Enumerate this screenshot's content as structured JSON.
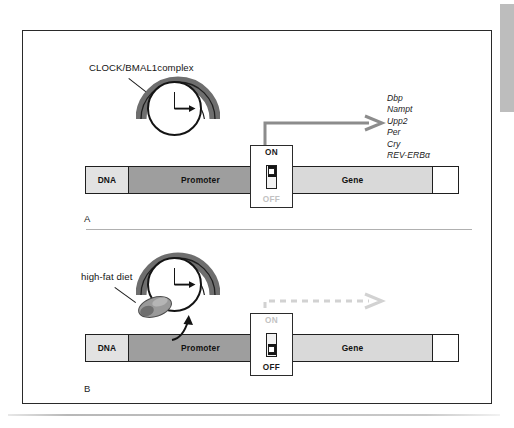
{
  "figure": {
    "type": "scientific-diagram",
    "panels": [
      {
        "id": "A",
        "label": "A",
        "state": "ON",
        "clock_label": "CLOCK/BMAL1complex",
        "switch": {
          "on_label": "ON",
          "off_label": "OFF",
          "position": "on"
        },
        "dna": {
          "segments": [
            {
              "name": "DNA",
              "label": "DNA",
              "shade": "light"
            },
            {
              "name": "Promoter",
              "label": "Promoter",
              "shade": "dark"
            },
            {
              "name": "Gene",
              "label": "Gene",
              "shade": "mid"
            },
            {
              "name": "tail",
              "label": "",
              "shade": "white"
            }
          ]
        },
        "arrow": {
          "style": "solid",
          "color": "#8c8c8c",
          "meaning": "active transcription"
        },
        "target_genes": [
          "Dbp",
          "Nampt",
          "Upp2",
          "Per",
          "Cry",
          "REV-ERBα"
        ]
      },
      {
        "id": "B",
        "label": "B",
        "state": "OFF",
        "perturbation_label": "high-fat diet",
        "switch": {
          "on_label": "ON",
          "off_label": "OFF",
          "position": "off"
        },
        "dna": {
          "segments": [
            {
              "name": "DNA",
              "label": "DNA",
              "shade": "light"
            },
            {
              "name": "Promoter",
              "label": "Promoter",
              "shade": "dark"
            },
            {
              "name": "Gene",
              "label": "Gene",
              "shade": "mid"
            },
            {
              "name": "tail",
              "label": "",
              "shade": "white"
            }
          ]
        },
        "arrow": {
          "style": "dashed",
          "color": "#d2d2d2",
          "meaning": "suppressed transcription"
        },
        "target_genes": []
      }
    ],
    "colors": {
      "promoter": "#9e9e9e",
      "gene": "#d9d9d9",
      "dna_block": "#e2e2e2",
      "complex_arc": "#6e6e6e",
      "arrow_active": "#8c8c8c",
      "arrow_suppressed": "#d2d2d2",
      "outline": "#1f1f1f",
      "mouse": "#9a9a9a"
    }
  }
}
